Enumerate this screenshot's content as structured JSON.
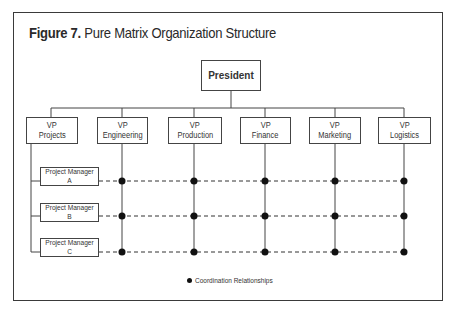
{
  "figure": {
    "label": "Figure 7.",
    "title": "Pure Matrix Organization Structure"
  },
  "president": {
    "label": "President"
  },
  "vps": [
    {
      "line1": "VP",
      "line2": "Projects"
    },
    {
      "line1": "VP",
      "line2": "Engineering"
    },
    {
      "line1": "VP",
      "line2": "Production"
    },
    {
      "line1": "VP",
      "line2": "Finance"
    },
    {
      "line1": "VP",
      "line2": "Marketing"
    },
    {
      "line1": "VP",
      "line2": "Logistics"
    }
  ],
  "project_managers": [
    {
      "line1": "Project Manager",
      "line2": "A"
    },
    {
      "line1": "Project Manager",
      "line2": "B"
    },
    {
      "line1": "Project Manager",
      "line2": "C"
    }
  ],
  "legend": {
    "symbol": "filled-dot",
    "label": "Coordination Relationships"
  },
  "matrix": {
    "rows": [
      "Project Manager A",
      "Project Manager B",
      "Project Manager C"
    ],
    "columns": [
      "VP Engineering",
      "VP Production",
      "VP Finance",
      "VP Marketing",
      "VP Logistics"
    ],
    "relationship": "Coordination Relationships"
  },
  "colors": {
    "line": "#444444",
    "dot": "#111111",
    "frame": "#3a3a3a"
  }
}
